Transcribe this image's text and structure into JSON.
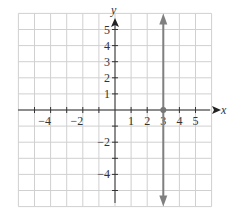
{
  "chart_data": {
    "type": "line",
    "title": "",
    "xlabel": "x",
    "ylabel": "y",
    "xlim": [
      -6,
      6
    ],
    "ylim": [
      -6,
      6
    ],
    "grid": true,
    "x_tick_labels": [
      "-4",
      "-2",
      "1",
      "2",
      "3",
      "4",
      "5"
    ],
    "y_tick_labels": [
      "5",
      "4",
      "3",
      "2",
      "1",
      "-2",
      "-4"
    ],
    "series": [
      {
        "name": "vertical line x = 3",
        "x": [
          3,
          3
        ],
        "y": [
          -6,
          6
        ],
        "color": "#808080",
        "arrows": "both"
      }
    ],
    "points": [
      {
        "x": 3,
        "y": 0,
        "label": "x-intercept"
      }
    ]
  },
  "labels": {
    "x_axis": "x",
    "y_axis": "y",
    "xticks": [
      {
        "text": "−4",
        "v": -4
      },
      {
        "text": "−2",
        "v": -2
      },
      {
        "text": "1",
        "v": 1
      },
      {
        "text": "2",
        "v": 2
      },
      {
        "text": "3",
        "v": 3
      },
      {
        "text": "4",
        "v": 4
      },
      {
        "text": "5",
        "v": 5
      }
    ],
    "yticks": [
      {
        "text": "5",
        "v": 5
      },
      {
        "text": "4",
        "v": 4
      },
      {
        "text": "3",
        "v": 3
      },
      {
        "text": "2",
        "v": 2
      },
      {
        "text": "1",
        "v": 1
      },
      {
        "text": "−2",
        "v": -2
      },
      {
        "text": "−4",
        "v": -4
      }
    ]
  },
  "colors": {
    "grid": "#d0d0d0",
    "axis": "#333333",
    "line": "#808080"
  }
}
